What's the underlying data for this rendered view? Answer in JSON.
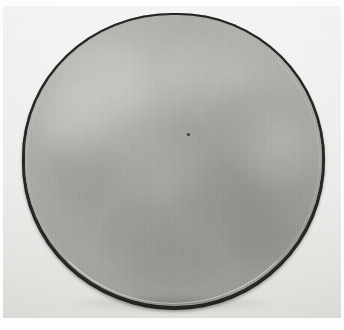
{
  "image": {
    "type": "photograph",
    "caption": "",
    "width": 344,
    "height": 330,
    "description": "Photograph of a round gray specimen disc with a dark irregular rim on a light gray background"
  },
  "background": {
    "name": "plate-background",
    "color": "#ececeb",
    "highlight_color": "#f1f1f0",
    "shadow_color": "#e2e2df",
    "margin_color": "#fdfdfd"
  },
  "specimen": {
    "name": "circular-specimen",
    "shape": "circle",
    "face_color": "#a9a9a5",
    "face_light_color": "#b3b3af",
    "face_dark_color": "#9b9b96",
    "rim_color": "#2a2a28",
    "lip_color": "#ffffff",
    "center_x": 171,
    "center_y": 156,
    "diameter": 303,
    "label": "",
    "speck": {
      "name": "surface-speck",
      "x": 184,
      "y": 127,
      "color": "#3c3c3a"
    }
  },
  "annotations": {
    "scale_bar": "",
    "label_text": "",
    "overlay_text": ""
  }
}
